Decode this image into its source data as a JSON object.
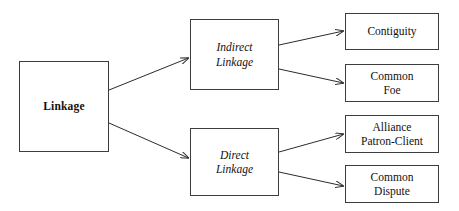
{
  "diagram": {
    "background_color": "#ffffff",
    "border_color": "#3d3d3d",
    "text_color": "#111111",
    "edge_color": "#2b2b2b",
    "nodes": {
      "root": {
        "label": "Linkage"
      },
      "indirect": {
        "label": "Indirect\nLinkage"
      },
      "direct": {
        "label": "Direct\nLinkage"
      },
      "contiguity": {
        "label": "Contiguity"
      },
      "common_foe": {
        "label": "Common\nFoe"
      },
      "alliance": {
        "label": "Alliance\nPatron-Client"
      },
      "common_dispute": {
        "label": "Common\nDispute"
      }
    },
    "edges": [
      {
        "from": "Linkage",
        "to": "Indirect Linkage"
      },
      {
        "from": "Linkage",
        "to": "Direct Linkage"
      },
      {
        "from": "Indirect Linkage",
        "to": "Contiguity"
      },
      {
        "from": "Indirect Linkage",
        "to": "Common Foe"
      },
      {
        "from": "Direct Linkage",
        "to": "Alliance Patron-Client"
      },
      {
        "from": "Direct Linkage",
        "to": "Common Dispute"
      }
    ]
  }
}
